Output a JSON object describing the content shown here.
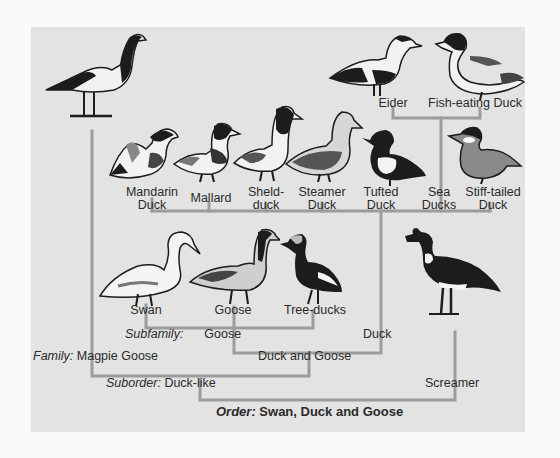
{
  "colors": {
    "background": "#fafafa",
    "panel": "#e3e3e3",
    "tree_line": "#9c9c9c",
    "text": "#2a2a2a",
    "bird_dark": "#1c1c1c",
    "bird_light": "#f4f4f4"
  },
  "birds": {
    "magpie_goose": {
      "name": "Magpie Goose"
    },
    "mandarin": {
      "label_line1": "Mandarin",
      "label_line2": "Duck"
    },
    "mallard": {
      "label_line1": "Mallard"
    },
    "shelduck": {
      "label_line1": "Sheld-",
      "label_line2": "duck"
    },
    "steamer": {
      "label_line1": "Steamer",
      "label_line2": "Duck"
    },
    "tufted": {
      "label_line1": "Tufted",
      "label_line2": "Duck"
    },
    "sea_ducks": {
      "label_line1": "Sea",
      "label_line2": "Ducks"
    },
    "stiff_tailed": {
      "label_line1": "Stiff-tailed",
      "label_line2": "Duck"
    },
    "eider": {
      "label": "Eider"
    },
    "fish_eating": {
      "label": "Fish-eating Duck"
    },
    "swan": {
      "label": "Swan"
    },
    "goose": {
      "label": "Goose"
    },
    "tree_ducks": {
      "label": "Tree-ducks"
    },
    "screamer": {
      "label": "Screamer"
    }
  },
  "taxonomy": {
    "subfamily": {
      "prefix": "Subfamily:",
      "goose": "Goose",
      "duck": "Duck"
    },
    "family": {
      "prefix": "Family:",
      "magpie_goose": "Magpie Goose",
      "duck_and_goose": "Duck and Goose"
    },
    "suborder": {
      "prefix": "Suborder:",
      "duck_like": "Duck-like",
      "screamer": "Screamer"
    },
    "order": {
      "prefix": "Order:",
      "name": "Swan, Duck and Goose"
    }
  }
}
